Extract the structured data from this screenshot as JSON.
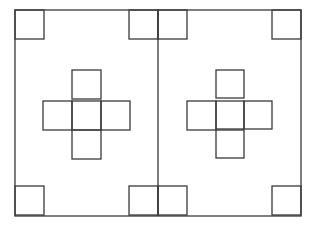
{
  "diagram": {
    "stroke_color": "#3a3a3a",
    "background": "#ffffff",
    "outer_frame": {
      "x": 15,
      "y": 10,
      "w": 286,
      "h": 206
    },
    "divider_x": 158,
    "panels": [
      {
        "name": "left-panel",
        "corner_squares": [
          {
            "x": 15,
            "y": 10,
            "s": 29
          },
          {
            "x": 129,
            "y": 10,
            "s": 29
          },
          {
            "x": 15,
            "y": 186,
            "s": 29
          },
          {
            "x": 129,
            "y": 186,
            "s": 29
          }
        ],
        "cross_squares": [
          {
            "x": 72,
            "y": 70,
            "s": 29
          },
          {
            "x": 43,
            "y": 101,
            "s": 29
          },
          {
            "x": 72,
            "y": 101,
            "s": 29
          },
          {
            "x": 101,
            "y": 101,
            "s": 29
          },
          {
            "x": 72,
            "y": 130,
            "s": 29
          }
        ]
      },
      {
        "name": "right-panel",
        "corner_squares": [
          {
            "x": 158,
            "y": 10,
            "s": 29
          },
          {
            "x": 272,
            "y": 10,
            "s": 29
          },
          {
            "x": 158,
            "y": 186,
            "s": 29
          },
          {
            "x": 272,
            "y": 186,
            "s": 29
          }
        ],
        "cross_squares": [
          {
            "x": 216,
            "y": 70,
            "s": 28
          },
          {
            "x": 187,
            "y": 101,
            "s": 29
          },
          {
            "x": 216,
            "y": 101,
            "s": 28
          },
          {
            "x": 244,
            "y": 101,
            "s": 28
          },
          {
            "x": 216,
            "y": 130,
            "s": 28
          }
        ]
      }
    ]
  }
}
